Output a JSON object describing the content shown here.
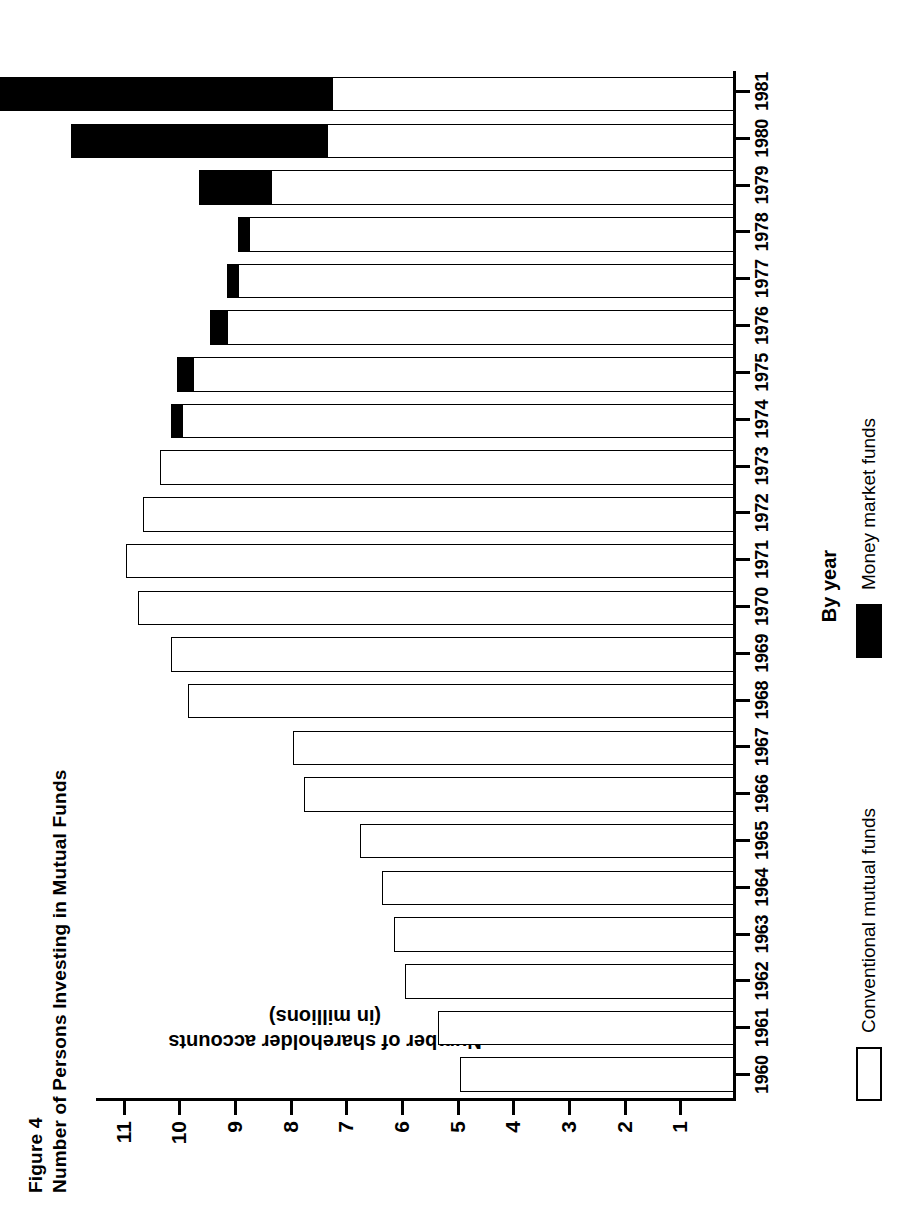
{
  "figure": {
    "number": "Figure 4",
    "title": "Number of Persons Investing in Mutual Funds"
  },
  "legend": {
    "items": [
      {
        "label": "Conventional mutual funds",
        "swatch": "white-square-outline",
        "color": "#ffffff"
      },
      {
        "label": "Money market funds",
        "swatch": "black-square",
        "color": "#000000"
      }
    ]
  },
  "axes": {
    "x_title": "By year",
    "y_title_line1": "Number of shareholder accounts",
    "y_title_line2": "(in millions)",
    "y_ticks": [
      "11",
      "10",
      "9",
      "8",
      "7",
      "6",
      "5",
      "4",
      "3",
      "2",
      "1"
    ]
  },
  "chart_data": {
    "type": "bar",
    "orientation": "vertical-stacked",
    "title": "Number of Persons Investing in Mutual Funds",
    "xlabel": "By year",
    "ylabel": "Number of shareholder accounts (in millions)",
    "ylim": [
      0,
      11.5
    ],
    "grid": false,
    "legend_position": "below-axis-left",
    "categories": [
      "1960",
      "1961",
      "1962",
      "1963",
      "1964",
      "1965",
      "1966",
      "1967",
      "1968",
      "1969",
      "1970",
      "1971",
      "1972",
      "1973",
      "1974",
      "1975",
      "1976",
      "1977",
      "1978",
      "1979",
      "1980",
      "1981"
    ],
    "series": [
      {
        "name": "Conventional mutual funds",
        "color": "#ffffff",
        "values": [
          4.9,
          5.3,
          5.9,
          6.1,
          6.3,
          6.7,
          7.7,
          7.9,
          9.8,
          10.1,
          10.7,
          10.9,
          10.6,
          10.3,
          9.9,
          9.7,
          9.1,
          8.9,
          8.7,
          8.3,
          7.3,
          7.2
        ]
      },
      {
        "name": "Money market funds",
        "color": "#000000",
        "values": [
          0,
          0,
          0,
          0,
          0,
          0,
          0,
          0,
          0,
          0,
          0,
          0,
          0,
          0,
          0.2,
          0.3,
          0.3,
          0.2,
          0.2,
          1.3,
          4.6,
          10.3
        ]
      }
    ]
  }
}
